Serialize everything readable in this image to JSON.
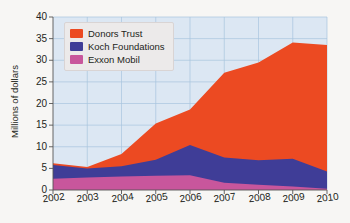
{
  "chart_data": {
    "type": "area",
    "stacked": true,
    "title": "",
    "xlabel": "",
    "ylabel": "Millions of dollars",
    "categories": [
      "2002",
      "2003",
      "2004",
      "2005",
      "2006",
      "2007",
      "2008",
      "2009",
      "2010"
    ],
    "x": [
      2002,
      2003,
      2004,
      2005,
      2006,
      2007,
      2008,
      2009,
      2010
    ],
    "xlim": [
      2002,
      2010
    ],
    "ylim": [
      0,
      40
    ],
    "yticks": [
      0,
      5,
      10,
      15,
      20,
      25,
      30,
      35,
      40
    ],
    "xticks": [
      "2002",
      "2003",
      "2004",
      "2005",
      "2006",
      "2007",
      "2008",
      "2009",
      "2010"
    ],
    "grid": true,
    "grid_color": "#a8c4de",
    "plot_background": "#dce7f3",
    "legend_position": "top-left",
    "series": [
      {
        "name": "Exxon Mobil",
        "color": "#c8569c",
        "values": [
          2.6,
          2.9,
          3.1,
          3.3,
          3.4,
          1.7,
          1.2,
          0.8,
          0.3
        ]
      },
      {
        "name": "Koch Foundations",
        "color": "#3f3d97",
        "values": [
          3.2,
          2.1,
          2.4,
          3.7,
          7.0,
          5.8,
          5.7,
          6.4,
          4.0
        ]
      },
      {
        "name": "Donors Trust",
        "color": "#ec4a22",
        "values": [
          0.4,
          0.3,
          2.8,
          8.4,
          8.2,
          19.6,
          22.6,
          26.9,
          29.2
        ]
      }
    ],
    "cumulative_tops": {
      "exxon_mobil": [
        2.6,
        2.9,
        3.1,
        3.3,
        3.4,
        1.7,
        1.2,
        0.8,
        0.3
      ],
      "koch_foundations": [
        5.8,
        5.0,
        5.5,
        7.0,
        10.4,
        7.5,
        6.9,
        7.2,
        4.3
      ],
      "donors_trust": [
        6.2,
        5.3,
        8.3,
        15.4,
        18.6,
        27.1,
        29.5,
        34.1,
        33.5
      ]
    }
  },
  "legend": {
    "items": [
      {
        "label": "Donors Trust",
        "color": "#ec4a22"
      },
      {
        "label": "Koch Foundations",
        "color": "#3f3d97"
      },
      {
        "label": "Exxon Mobil",
        "color": "#c8569c"
      }
    ]
  },
  "axes": {
    "y_title": "Millions of dollars"
  }
}
